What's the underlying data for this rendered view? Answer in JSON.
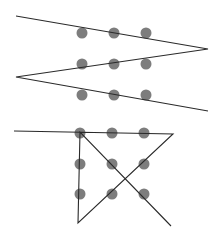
{
  "colors": {
    "background": "#ffffff",
    "dot": "#7d7d7d",
    "line": "#2a2a2a"
  },
  "dot_radius": 5.5,
  "puzzles": [
    {
      "name": "zigzag-solution",
      "dots": [
        [
          82,
          33
        ],
        [
          114,
          33
        ],
        [
          146,
          33
        ],
        [
          82,
          64
        ],
        [
          114,
          64
        ],
        [
          146,
          64
        ],
        [
          82,
          95
        ],
        [
          114,
          95
        ],
        [
          146,
          95
        ]
      ],
      "path": [
        [
          16,
          16
        ],
        [
          208,
          49
        ],
        [
          16,
          77
        ],
        [
          208,
          111
        ]
      ]
    },
    {
      "name": "four-line-solution",
      "dots": [
        [
          80,
          133
        ],
        [
          112,
          133
        ],
        [
          144,
          133
        ],
        [
          80,
          164
        ],
        [
          112,
          164
        ],
        [
          144,
          164
        ],
        [
          80,
          194
        ],
        [
          112,
          194
        ],
        [
          144,
          194
        ]
      ],
      "path": [
        [
          14,
          131
        ],
        [
          173,
          134
        ],
        [
          78,
          223
        ],
        [
          80,
          132
        ],
        [
          171,
          226
        ]
      ]
    }
  ]
}
